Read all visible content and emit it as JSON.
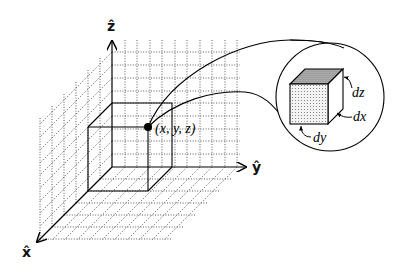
{
  "figure": {
    "axes": {
      "z_label": "ẑ",
      "y_label": "ŷ",
      "x_label": "x̂"
    },
    "point_label": "(x, y, z)",
    "inset": {
      "labels": {
        "dz": "dz",
        "dx": "dx",
        "dy": "dy"
      }
    },
    "colors": {
      "line": "#000000",
      "grid": "#333333",
      "background": "#ffffff",
      "cube_top": "#a0a0a0",
      "cube_front": "#d8d8d8"
    }
  }
}
